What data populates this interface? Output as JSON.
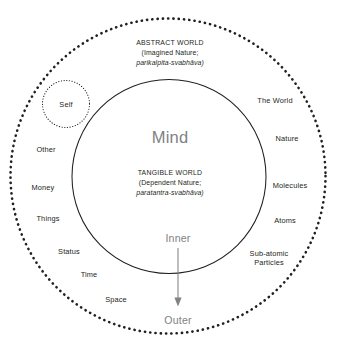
{
  "diagram": {
    "colors": {
      "stroke": "#231f20",
      "text": "#231f20",
      "muted": "#808284",
      "background": "#ffffff"
    },
    "regions": {
      "abstract": {
        "line1": "ABSTRACT WORLD",
        "line2": "(Imagined Nature;",
        "line3": "parikalpita-svabhāva)"
      },
      "tangible": {
        "line1": "TANGIBLE WORLD",
        "line2": "(Dependent Nature;",
        "line3": "paratantra-svabhāva)"
      }
    },
    "center_label": "Mind",
    "self_label": "Self",
    "flow": {
      "inner": "Inner",
      "outer": "Outer",
      "arrow": "down-arrow"
    },
    "left_labels": [
      "Other",
      "Money",
      "Things",
      "Status",
      "Time",
      "Space"
    ],
    "right_labels": [
      "The World",
      "Nature",
      "Molecules",
      "Atoms",
      "Sub-atomic Particles"
    ],
    "right_labels_wrapped": [
      [
        "The World"
      ],
      [
        "Nature"
      ],
      [
        "Molecules"
      ],
      [
        "Atoms"
      ],
      [
        "Sub-atomic",
        "Particles"
      ]
    ]
  }
}
